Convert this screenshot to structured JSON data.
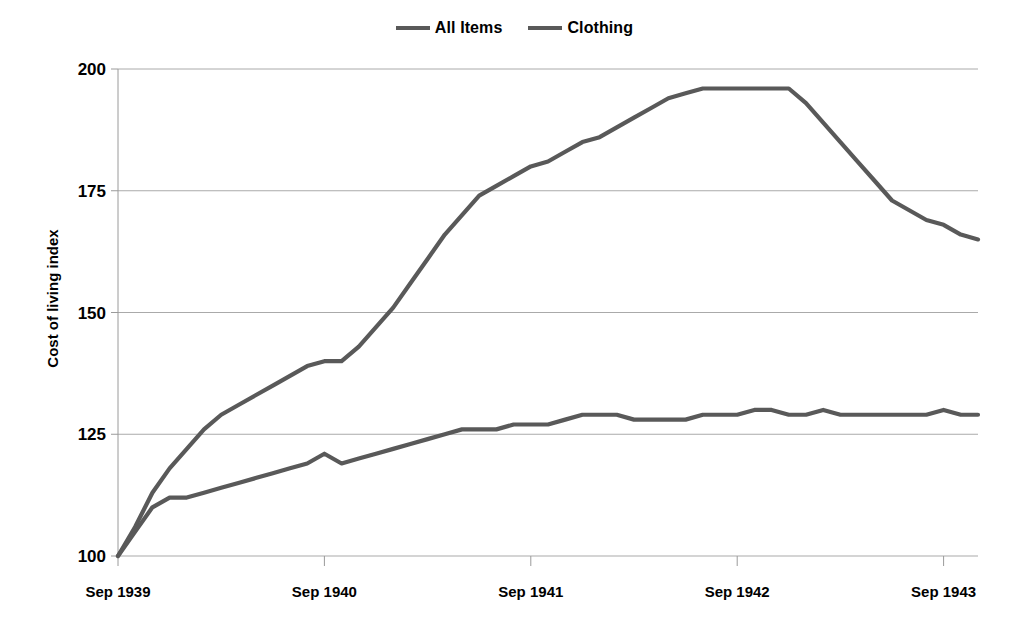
{
  "chart_data": {
    "type": "line",
    "title": "",
    "subtitle": "",
    "xlabel": "",
    "ylabel": "Cost of living index",
    "ylim": [
      100,
      200
    ],
    "yticks": [
      100,
      125,
      150,
      175,
      200
    ],
    "ytick_labels": [
      "100",
      "125",
      "150",
      "175",
      "200"
    ],
    "xtick_labels": [
      "Sep 1939",
      "Sep 1940",
      "Sep 1941",
      "Sep 1942",
      "Sep 1943"
    ],
    "xtick_values": [
      0,
      12,
      24,
      36,
      48
    ],
    "xlim": [
      0,
      50
    ],
    "grid": "horizontal",
    "legend_position": "top-center",
    "legend": [
      "All Items",
      "Clothing"
    ],
    "series": [
      {
        "name": "All Items",
        "color": "#595959",
        "x": [
          0,
          1,
          2,
          3,
          4,
          5,
          6,
          7,
          8,
          9,
          10,
          11,
          12,
          13,
          14,
          15,
          16,
          17,
          18,
          19,
          20,
          21,
          22,
          23,
          24,
          25,
          26,
          27,
          28,
          29,
          30,
          31,
          32,
          33,
          34,
          35,
          36,
          37,
          38,
          39,
          40,
          41,
          42,
          43,
          44,
          45,
          46,
          47,
          48,
          49,
          50
        ],
        "values": [
          100,
          106,
          113,
          118,
          122,
          126,
          129,
          131,
          133,
          135,
          137,
          139,
          140,
          140,
          143,
          147,
          151,
          156,
          161,
          166,
          170,
          174,
          176,
          178,
          180,
          181,
          183,
          185,
          186,
          188,
          190,
          192,
          194,
          195,
          196,
          196,
          196,
          196,
          196,
          196,
          193,
          189,
          185,
          181,
          177,
          173,
          171,
          169,
          168,
          166,
          165
        ]
      },
      {
        "name": "Clothing",
        "color": "#595959",
        "x": [
          0,
          1,
          2,
          3,
          4,
          5,
          6,
          7,
          8,
          9,
          10,
          11,
          12,
          13,
          14,
          15,
          16,
          17,
          18,
          19,
          20,
          21,
          22,
          23,
          24,
          25,
          26,
          27,
          28,
          29,
          30,
          31,
          32,
          33,
          34,
          35,
          36,
          37,
          38,
          39,
          40,
          41,
          42,
          43,
          44,
          45,
          46,
          47,
          48,
          49,
          50
        ],
        "values": [
          100,
          105,
          110,
          112,
          112,
          113,
          114,
          115,
          116,
          117,
          118,
          119,
          121,
          119,
          120,
          121,
          122,
          123,
          124,
          125,
          126,
          126,
          126,
          127,
          127,
          127,
          128,
          129,
          129,
          129,
          128,
          128,
          128,
          128,
          129,
          129,
          129,
          130,
          130,
          129,
          129,
          130,
          129,
          129,
          129,
          129,
          129,
          129,
          130,
          129,
          129
        ]
      }
    ]
  },
  "axes": {
    "y_title": "Cost of living index"
  },
  "colors": {
    "line": "#595959",
    "grid": "#aaaaaa",
    "axis": "#9a9a9a",
    "text": "#000000"
  }
}
